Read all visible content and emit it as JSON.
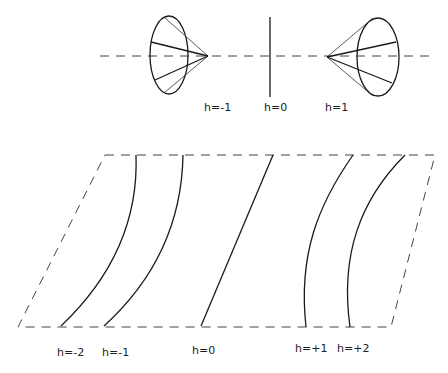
{
  "top_diagram": {
    "axis": {
      "x1": 100,
      "x2": 432,
      "y": 56
    },
    "center_line": {
      "x": 270,
      "y1": 17,
      "y2": 97
    },
    "labels": [
      {
        "id": "h-neg1",
        "text": "h=-1",
        "x": 204,
        "y": 111
      },
      {
        "id": "h-0",
        "text": "h=0",
        "x": 264,
        "y": 111
      },
      {
        "id": "h-pos1",
        "text": "h=1",
        "x": 325,
        "y": 111
      }
    ],
    "cones": [
      {
        "id": "left-cone",
        "apex": [
          208,
          56
        ],
        "ellipse": {
          "cx": 169,
          "cy": 55,
          "rx": 19,
          "ry": 39
        }
      },
      {
        "id": "right-cone",
        "apex": [
          327,
          57
        ],
        "ellipse": {
          "cx": 378,
          "cy": 57,
          "rx": 21,
          "ry": 39
        }
      }
    ]
  },
  "bottom_diagram": {
    "parallelogram": {
      "tl": [
        105,
        155
      ],
      "tr": [
        435,
        155
      ],
      "br": [
        391,
        327
      ],
      "bl": [
        18,
        327
      ]
    },
    "curves": [
      {
        "id": "curve-h-neg2",
        "label": "h=-2",
        "label_x": 57,
        "label_y": 356
      },
      {
        "id": "curve-h-neg1",
        "label": "h=-1",
        "label_x": 102,
        "label_y": 356
      },
      {
        "id": "curve-h-0",
        "label": "h=0",
        "label_x": 192,
        "label_y": 354
      },
      {
        "id": "curve-h-pos1",
        "label": "h=+1",
        "label_x": 295,
        "label_y": 352
      },
      {
        "id": "curve-h-pos2",
        "label": "h=+2",
        "label_x": 337,
        "label_y": 352
      }
    ]
  }
}
